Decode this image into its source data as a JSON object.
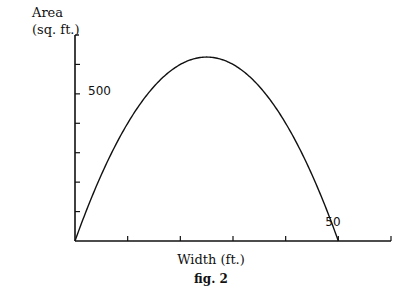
{
  "chart_data": {
    "type": "line",
    "title": "",
    "caption": "fig. 2",
    "xlabel": "Width (ft.)",
    "ylabel_lines": [
      "Area",
      "(sq. ft.)"
    ],
    "xlim": [
      0,
      60
    ],
    "ylim": [
      0,
      700
    ],
    "x_tick_step": 10,
    "y_tick_step": 100,
    "labeled_ticks": {
      "y": [
        {
          "value": 500,
          "label": "500"
        }
      ],
      "x": [
        {
          "value": 50,
          "label": "50"
        }
      ]
    },
    "grid": false,
    "legend": null,
    "series": [
      {
        "name": "Area = Width × (50 − Width)",
        "x": [
          0,
          5,
          10,
          15,
          20,
          25,
          30,
          35,
          40,
          45,
          50
        ],
        "y": [
          0,
          225,
          400,
          525,
          600,
          625,
          600,
          525,
          400,
          225,
          0
        ]
      }
    ],
    "annotations": [
      {
        "text": "50",
        "x": 50,
        "y": 0,
        "note": "curve crosses x-axis at width 50"
      }
    ]
  },
  "colors": {
    "line": "#111111",
    "background": "#ffffff"
  }
}
